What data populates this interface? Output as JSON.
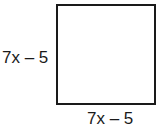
{
  "figure": {
    "shape": "square",
    "left_side_label": "7x – 5",
    "bottom_side_label": "7x – 5"
  },
  "colors": {
    "stroke": "#1a1a1a",
    "fill": "#ffffff"
  }
}
